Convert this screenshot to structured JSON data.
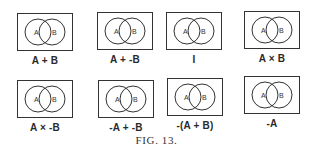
{
  "figure": {
    "caption": "Fig. 13.",
    "caption_display": "FIG. 13.",
    "stroke_color": "#333333",
    "background": "#ffffff",
    "diagrams": [
      {
        "circle_a": "A",
        "circle_b": "B",
        "label": "A + B"
      },
      {
        "circle_a": "A",
        "circle_b": "B",
        "label": "A + -B"
      },
      {
        "circle_a": "A",
        "circle_b": "B",
        "label": "I"
      },
      {
        "circle_a": "A",
        "circle_b": "B",
        "label": "A × B"
      },
      {
        "circle_a": "A",
        "circle_b": "B",
        "label": "A × -B"
      },
      {
        "circle_a": "A",
        "circle_b": "B",
        "label": "-A + -B"
      },
      {
        "circle_a": "A",
        "circle_b": "B",
        "label": "-(A + B)"
      },
      {
        "circle_a": "A",
        "circle_b": "B",
        "label": "-A"
      }
    ]
  }
}
